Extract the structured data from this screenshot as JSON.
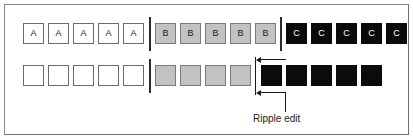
{
  "figure": {
    "caption_label": "Ripple edit",
    "colors": {
      "frame": "#8a8a8a",
      "clip_a_fill": "#ffffff",
      "clip_b_fill": "#c2c2c2",
      "clip_c_fill": "#0b0b0b",
      "outline": "#6b6b6b",
      "divider": "#2b2b2b",
      "annotation": "#1a1a1a",
      "background": "#ffffff"
    }
  },
  "timeline_before": {
    "name": "before-row",
    "clips": [
      {
        "label": "A",
        "kind": "a"
      },
      {
        "label": "A",
        "kind": "a"
      },
      {
        "label": "A",
        "kind": "a"
      },
      {
        "label": "A",
        "kind": "a"
      },
      {
        "label": "A",
        "kind": "a"
      },
      {
        "label": "B",
        "kind": "b"
      },
      {
        "label": "B",
        "kind": "b"
      },
      {
        "label": "B",
        "kind": "b"
      },
      {
        "label": "B",
        "kind": "b"
      },
      {
        "label": "B",
        "kind": "b"
      },
      {
        "label": "C",
        "kind": "c"
      },
      {
        "label": "C",
        "kind": "c"
      },
      {
        "label": "C",
        "kind": "c"
      },
      {
        "label": "C",
        "kind": "c"
      },
      {
        "label": "C",
        "kind": "c"
      }
    ],
    "divider_count": 2
  },
  "timeline_after": {
    "name": "after-row",
    "clips": [
      {
        "label": "",
        "kind": "a"
      },
      {
        "label": "",
        "kind": "a"
      },
      {
        "label": "",
        "kind": "a"
      },
      {
        "label": "",
        "kind": "a"
      },
      {
        "label": "",
        "kind": "a"
      },
      {
        "label": "",
        "kind": "b"
      },
      {
        "label": "",
        "kind": "b"
      },
      {
        "label": "",
        "kind": "b"
      },
      {
        "label": "",
        "kind": "b"
      },
      {
        "label": "",
        "kind": "c"
      },
      {
        "label": "",
        "kind": "c"
      },
      {
        "label": "",
        "kind": "c"
      },
      {
        "label": "",
        "kind": "c"
      },
      {
        "label": "",
        "kind": "c"
      }
    ],
    "divider_count": 1
  },
  "annotation": {
    "label": "Ripple edit",
    "arrow_count": 2,
    "direction": "left"
  }
}
